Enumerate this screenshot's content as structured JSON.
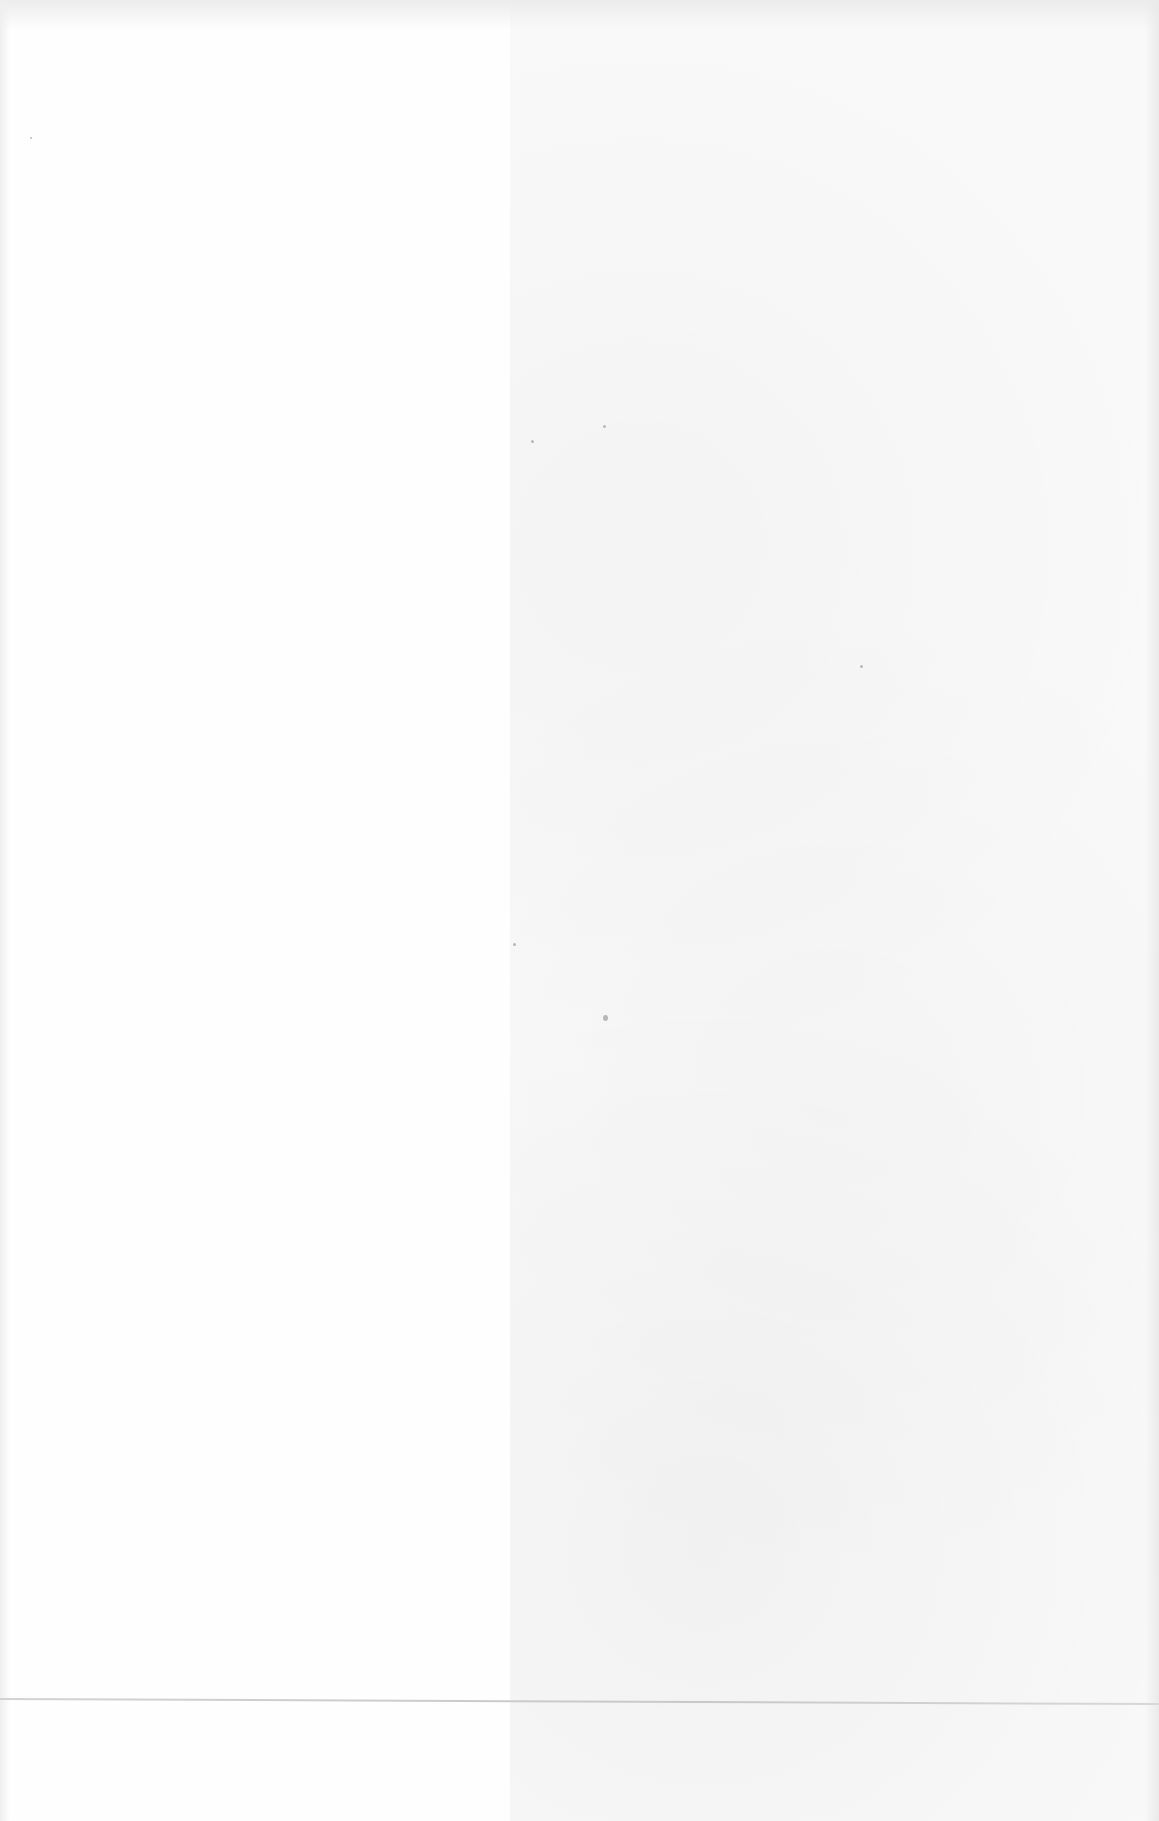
{
  "page": {
    "type": "scanned-blank-page",
    "text_content": ""
  }
}
